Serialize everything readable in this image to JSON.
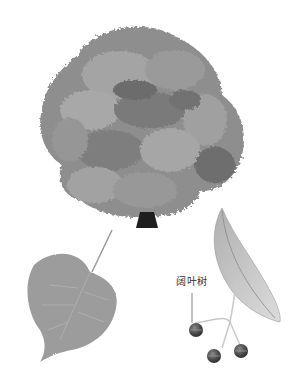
{
  "illustration": {
    "subjects": [
      "tree",
      "leaf",
      "seed-cluster-with-bract"
    ],
    "colors": {
      "foliage_light": "#a8a8a8",
      "foliage_mid": "#8a8a8a",
      "foliage_dark": "#6a6a6a",
      "trunk": "#1e1e1e",
      "leaf": "#9c9c9c",
      "bract": "#c4c4c4",
      "fruit": "#4a4a4a",
      "background": "#ffffff"
    }
  },
  "annotation": {
    "label": "阔叶树"
  }
}
